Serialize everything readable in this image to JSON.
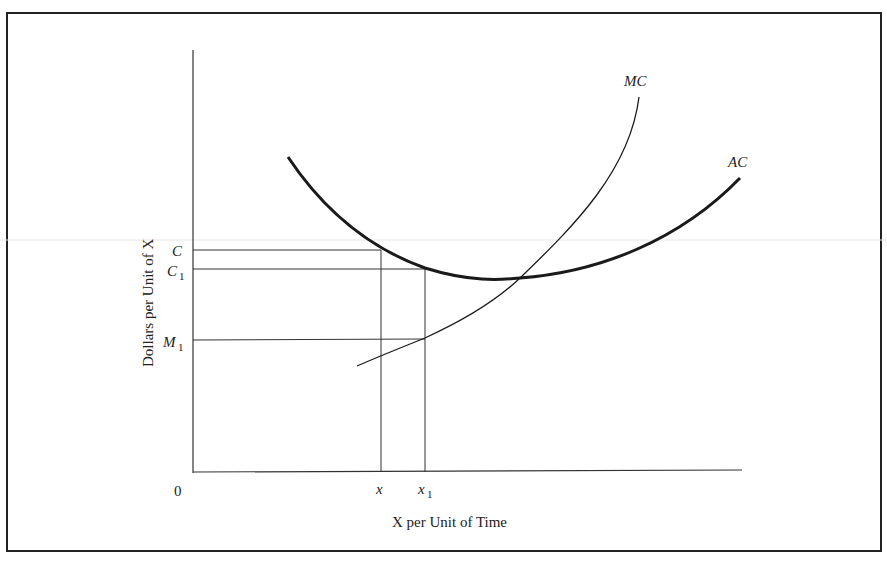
{
  "figure": {
    "type": "cost curves diagram",
    "y_axis_label": "Dollars per Unit of X",
    "x_axis_label": "X per Unit of Time",
    "origin_label": "0",
    "curves": [
      {
        "name": "AC",
        "label": "AC",
        "style": "thick"
      },
      {
        "name": "MC",
        "label": "MC",
        "style": "thin"
      }
    ],
    "y_ticks": [
      {
        "label": "C",
        "sub": ""
      },
      {
        "label": "C",
        "sub": "1"
      },
      {
        "label": "M",
        "sub": "1"
      }
    ],
    "x_ticks": [
      {
        "label": "x",
        "sub": ""
      },
      {
        "label": "x",
        "sub": "1"
      }
    ],
    "colors": {
      "ink": "#222222",
      "background": "#ffffff"
    }
  }
}
